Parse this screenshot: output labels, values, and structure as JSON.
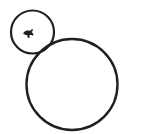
{
  "canvas": {
    "width": 141,
    "height": 134,
    "background_color": "#ffffff",
    "title": "Two overlapping circle outlines line drawing"
  },
  "style": {
    "stroke_color": "#231f20",
    "glyph_color": "#231f20",
    "small_circle_stroke_width": 2.2,
    "large_circle_stroke_width": 2.4,
    "fill": "none"
  },
  "shapes": [
    {
      "name": "small-circle",
      "type": "circle",
      "cx": 32.5,
      "cy": 32.0,
      "r": 21.5,
      "label": "small circle"
    },
    {
      "name": "large-circle",
      "type": "circle",
      "cx": 72.0,
      "cy": 84.5,
      "r": 45.5,
      "label": "large circle"
    }
  ],
  "glyph": {
    "name": "small-dark-mark",
    "label": "tiny filled mark",
    "cx": 28.0,
    "cy": 33.0,
    "width": 10,
    "height": 8,
    "path": "M23.2,33.6 C23.9,32.1 25.2,31.0 26.7,30.6 C27.8,30.3 28.9,30.4 29.8,30.9 C30.4,30.2 31.1,29.6 31.9,29.3 C32.6,29.0 33.2,29.6 32.9,30.3 C32.6,31.0 32.1,31.6 31.5,32.1 C32.3,32.6 33.0,33.3 33.4,34.2 C33.7,34.9 33.1,35.6 32.4,35.4 C31.3,35.1 30.2,35.0 29.2,35.3 C29.6,36.0 29.7,36.8 29.5,37.5 C29.3,38.2 28.4,38.3 28.0,37.7 C27.5,36.9 27.3,36.0 27.3,35.2 C26.0,35.1 24.7,34.7 23.6,34.1 C23.2,33.9 23.1,33.8 23.2,33.6 Z"
  }
}
